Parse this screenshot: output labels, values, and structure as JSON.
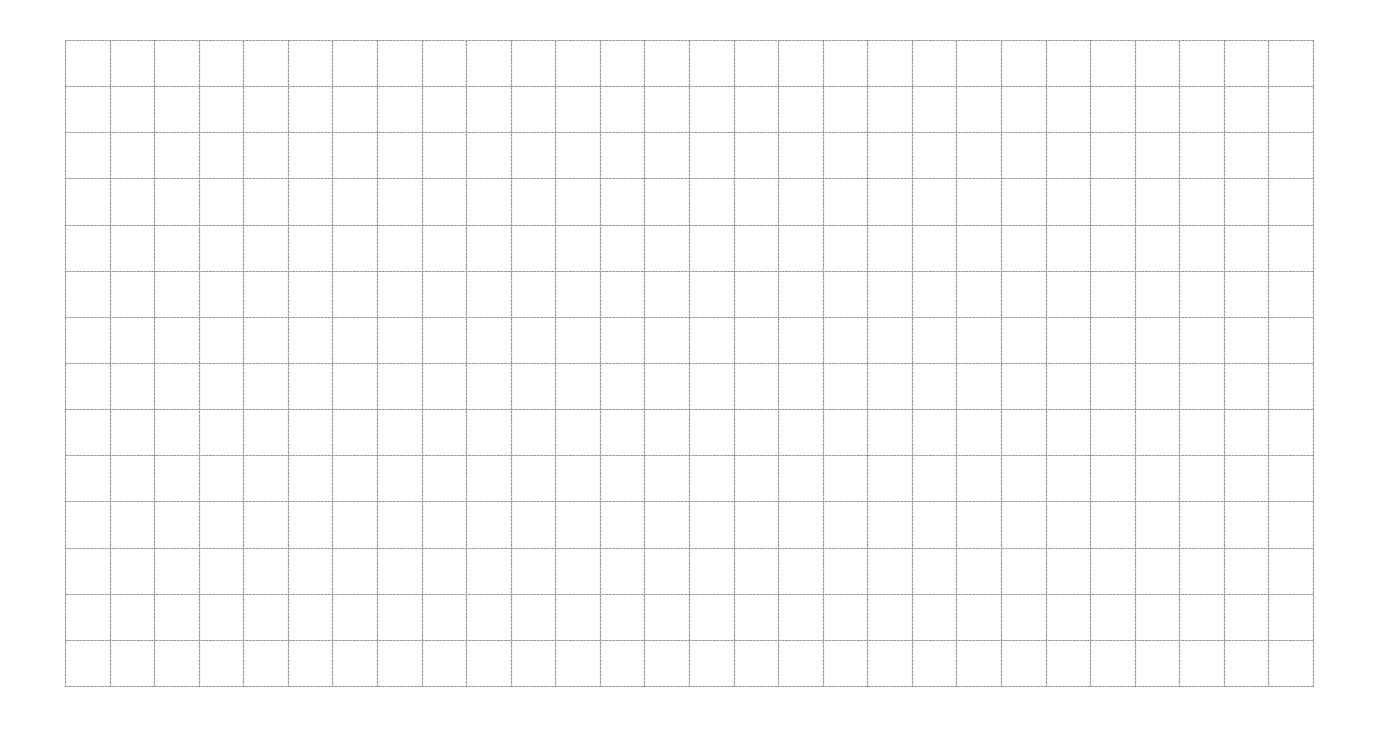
{
  "sheet": {
    "type": "blank grid paper",
    "columns": 28,
    "rows": 14,
    "origin": {
      "x": 65,
      "y": 40
    },
    "width": 1248,
    "height": 646,
    "line_color": "#9a9a9a",
    "background": "#ffffff"
  }
}
